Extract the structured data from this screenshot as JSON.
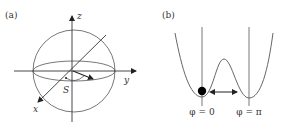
{
  "panel_a": {
    "label": "(a)",
    "axes": {
      "z": "z",
      "y": "y",
      "x": "x"
    },
    "vector_label": "S"
  },
  "panel_b": {
    "label": "(b)",
    "min_left_label": "φ = 0",
    "min_right_label": "φ = π"
  },
  "colors": {
    "stroke": "#444444",
    "fill": "#000000",
    "background": "#ffffff"
  }
}
